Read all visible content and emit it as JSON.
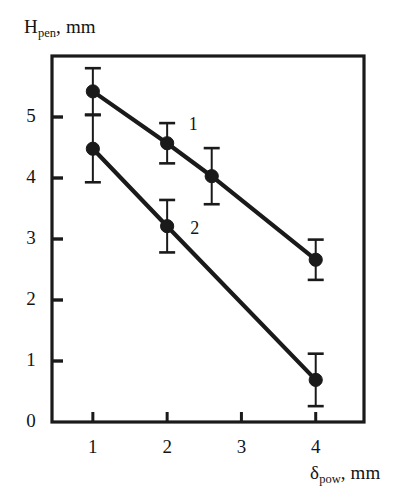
{
  "chart_data": {
    "type": "line",
    "title": "",
    "subtitle": "",
    "xlabel": "δpow, mm",
    "ylabel": "Hpen, mm",
    "xlabel_parts": {
      "main": "δ",
      "sub": "pow",
      "tail": ", mm"
    },
    "ylabel_parts": {
      "main": "H",
      "sub": "pen",
      "tail": ", mm"
    },
    "xlim": [
      0.45,
      4.65
    ],
    "ylim": [
      0,
      6.0
    ],
    "xticks": [
      1,
      2,
      3,
      4
    ],
    "xtick_labels": [
      "1",
      "2",
      "3",
      "4"
    ],
    "yticks": [
      0,
      1,
      2,
      3,
      4,
      5
    ],
    "ytick_labels": [
      "0",
      "1",
      "2",
      "3",
      "4",
      "5"
    ],
    "grid": false,
    "legend_position": "inline-annotation",
    "marker": "filled-circle",
    "error_bars": "symmetric-vertical-caps",
    "line_color": "#1a1a1a",
    "marker_color": "#1a1a1a",
    "series": [
      {
        "name": "1",
        "label": "1",
        "label_x": 2.35,
        "label_y": 4.85,
        "x": [
          1.0,
          2.0,
          2.6,
          4.0
        ],
        "values": [
          5.42,
          4.57,
          4.03,
          2.66
        ],
        "yerr": [
          0.38,
          0.33,
          0.46,
          0.33
        ]
      },
      {
        "name": "2",
        "label": "2",
        "label_x": 2.37,
        "label_y": 3.15,
        "x": [
          1.0,
          2.0,
          4.0
        ],
        "values": [
          4.48,
          3.21,
          0.69
        ],
        "yerr": [
          0.55,
          0.43,
          0.43
        ]
      }
    ]
  },
  "figure": {
    "frame_color": "#1a1a1a",
    "background": "#ffffff"
  }
}
